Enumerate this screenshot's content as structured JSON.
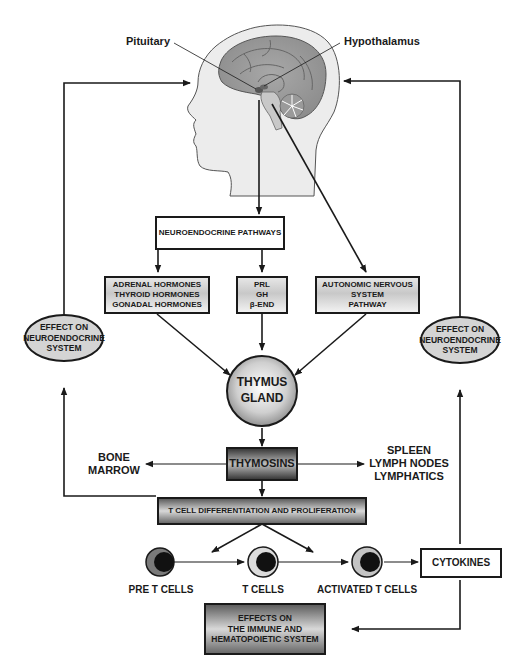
{
  "head_labels": {
    "pituitary": "Pituitary",
    "hypothalamus": "Hypothalamus"
  },
  "boxes": {
    "neuroendocrine_pathways": "NEUROENDOCRINE PATHWAYS",
    "hormones": "ADRENAL HORMONES\nTHYROID HORMONES\nGONADAL HORMONES",
    "prl_gh_bend": "PRL\nGH\nβ-END",
    "autonomic": "AUTONOMIC NERVOUS\nSYSTEM\nPATHWAY",
    "thymus_gland": "THYMUS\nGLAND",
    "thymosins": "THYMOSINS",
    "t_cell_diff": "T CELL DIFFERENTIATION AND PROLIFERATION",
    "cytokines": "CYTOKINES",
    "effects_immune": "EFFECTS ON\nTHE IMMUNE AND\nHEMATOPOIETIC SYSTEM"
  },
  "ellipses": {
    "left_effect": "EFFECT ON\nNEUROENDOCRINE\nSYSTEM",
    "right_effect": "EFFECT ON\nNEUROENDOCRINE\nSYSTEM"
  },
  "side_labels": {
    "bone_marrow": "BONE\nMARROW",
    "spleen_lymph": "SPLEEN\nLYMPH NODES\nLYMPHATICS"
  },
  "cells": [
    {
      "label": "PRE T CELLS"
    },
    {
      "label": "T CELLS"
    },
    {
      "label": "ACTIVATED T CELLS"
    }
  ],
  "icons": {
    "head": "human-head-brain-illustration",
    "cell": "cell-nucleus-icon"
  }
}
